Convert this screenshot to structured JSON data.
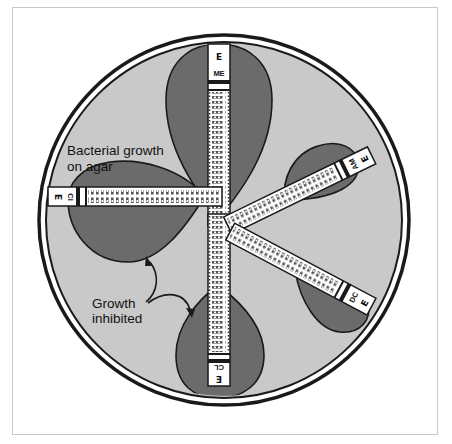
{
  "figure": {
    "title": "",
    "labels": {
      "growth_line1": "Bacterial growth",
      "growth_line2": "on agar",
      "inhibited_line1": "Growth",
      "inhibited_line2": "inhibited"
    },
    "colors": {
      "agar": "#c9c9c9",
      "inhibition_zone": "#6b6b6b",
      "dish_ring": "#1a1a1a",
      "strip": "#ffffff",
      "frame": "#c8c8c8"
    },
    "strips": [
      {
        "id": "top",
        "antibiotic": "ME",
        "logo": "E",
        "orientation": "vertical"
      },
      {
        "id": "left",
        "antibiotic": "CI",
        "logo": "E",
        "orientation": "horizontal"
      },
      {
        "id": "bottom",
        "antibiotic": "CL",
        "logo": "E",
        "orientation": "vertical"
      },
      {
        "id": "upper-right",
        "antibiotic": "AM",
        "logo": "E",
        "orientation": "diagonal"
      },
      {
        "id": "lower-right",
        "antibiotic": "DC",
        "logo": "E",
        "orientation": "diagonal"
      }
    ],
    "scale_values": [
      "256",
      "128",
      "64",
      "32",
      "16",
      "8",
      "4",
      "2",
      "1",
      ".5",
      ".25",
      ".125",
      ".064",
      ".047",
      ".032",
      ".023",
      ".016"
    ]
  }
}
